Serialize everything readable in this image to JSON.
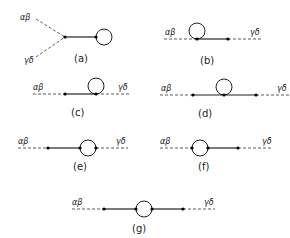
{
  "figure": {
    "diagrams": [
      {
        "id": "a",
        "caption": "(a)",
        "in_label": "αβ",
        "out_label": "γδ"
      },
      {
        "id": "b",
        "caption": "(b)",
        "in_label": "αβ",
        "out_label": "γδ"
      },
      {
        "id": "c",
        "caption": "(c)",
        "in_label": "αβ",
        "out_label": "γδ"
      },
      {
        "id": "d",
        "caption": "(d)",
        "in_label": "αβ",
        "out_label": "γδ"
      },
      {
        "id": "e",
        "caption": "(e)",
        "in_label": "αβ",
        "out_label": "γδ"
      },
      {
        "id": "f",
        "caption": "(f)",
        "in_label": "αβ",
        "out_label": "γδ"
      },
      {
        "id": "g",
        "caption": "(g)",
        "in_label": "αβ",
        "out_label": "γδ"
      }
    ]
  }
}
